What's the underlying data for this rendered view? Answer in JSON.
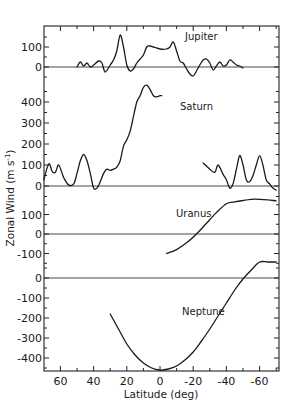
{
  "chart_data": {
    "type": "line",
    "title": "",
    "xlabel": "Latitude (deg)",
    "ylabel": "Zonal Wind (m s⁻¹)",
    "ylabel_parts": {
      "main": "Zonal Wind (m s",
      "sup": "-1",
      "close": ")"
    },
    "xlim": [
      70,
      -72
    ],
    "x_ticks": [
      60,
      40,
      20,
      0,
      -20,
      -40,
      -60
    ],
    "x_tick_labels": [
      "60",
      "40",
      "20",
      "0",
      "-20",
      "-40",
      "-60"
    ],
    "grid": false,
    "legend": "none (curves labeled inline)",
    "panels": [
      {
        "name": "Jupiter",
        "y_ticks": [
          100,
          0
        ],
        "y_tick_labels": [
          "100",
          "0"
        ],
        "zero_y": 67,
        "px_per_unit": 0.2,
        "label_pos": [
          185,
          40
        ],
        "x": [
          50,
          48,
          46,
          44,
          42,
          40,
          37,
          35,
          33,
          30,
          28,
          26,
          24,
          22,
          20,
          18,
          16,
          14,
          12,
          10,
          8,
          6,
          4,
          2,
          0,
          -2,
          -4,
          -6,
          -8,
          -10,
          -12,
          -14,
          -16,
          -18,
          -20,
          -22,
          -24,
          -26,
          -28,
          -30,
          -32,
          -34,
          -36,
          -38,
          -40,
          -42,
          -44,
          -46,
          -48,
          -50
        ],
        "values": [
          0,
          25,
          5,
          20,
          0,
          10,
          30,
          20,
          -25,
          10,
          35,
          80,
          160,
          100,
          10,
          -20,
          -10,
          20,
          40,
          60,
          100,
          105,
          100,
          95,
          90,
          88,
          90,
          100,
          125,
          80,
          30,
          20,
          -10,
          -35,
          -45,
          -20,
          10,
          35,
          40,
          20,
          -15,
          5,
          25,
          5,
          10,
          35,
          25,
          10,
          5,
          -5
        ]
      },
      {
        "name": "Saturn",
        "y_ticks": [
          400,
          300,
          200,
          100,
          0
        ],
        "y_tick_labels": [
          "400",
          "300",
          "200",
          "100",
          "0"
        ],
        "zero_y": 186,
        "px_per_unit": 0.21,
        "label_pos": [
          180,
          110
        ],
        "segments": [
          {
            "x": [
              70,
              67,
              65,
              63,
              61,
              58,
              55,
              52,
              50,
              48,
              46,
              44,
              42,
              40,
              38,
              36,
              34,
              32,
              30,
              28,
              26,
              24,
              22,
              20,
              18,
              16,
              14,
              12,
              10,
              8,
              6,
              4,
              2,
              0,
              -1
            ],
            "values": [
              30,
              105,
              70,
              65,
              100,
              40,
              5,
              10,
              60,
              120,
              150,
              120,
              60,
              -10,
              -10,
              20,
              60,
              80,
              75,
              80,
              90,
              120,
              190,
              220,
              260,
              330,
              400,
              430,
              470,
              480,
              460,
              430,
              425,
              430,
              430
            ]
          },
          {
            "x": [
              -26,
              -30,
              -33,
              -35,
              -38,
              -40,
              -42,
              -44,
              -46,
              -48,
              -50,
              -52,
              -54,
              -56,
              -58,
              -60,
              -62,
              -64,
              -66,
              -68,
              -70
            ],
            "values": [
              110,
              80,
              65,
              100,
              55,
              30,
              -10,
              10,
              80,
              145,
              100,
              30,
              20,
              50,
              100,
              145,
              100,
              30,
              10,
              -10,
              -20
            ]
          }
        ]
      },
      {
        "name": "Uranus",
        "y_ticks": [
          100,
          0,
          -100
        ],
        "y_tick_labels": [
          "100",
          "0",
          "-100"
        ],
        "zero_y": 234,
        "px_per_unit": 0.195,
        "label_pos": [
          176,
          217
        ],
        "x": [
          -4,
          -10,
          -16,
          -22,
          -28,
          -34,
          -40,
          -45,
          -50,
          -55,
          -60,
          -65,
          -70
        ],
        "values": [
          -100,
          -80,
          -45,
          0,
          55,
          110,
          155,
          165,
          172,
          178,
          178,
          175,
          170
        ]
      },
      {
        "name": "Neptune",
        "y_ticks": [
          0,
          -100,
          -200,
          -300,
          -400
        ],
        "y_tick_labels": [
          "0",
          "-100",
          "-200",
          "-300",
          "-400"
        ],
        "zero_y": 278,
        "px_per_unit": 0.2,
        "label_pos": [
          182,
          315
        ],
        "x": [
          30,
          25,
          20,
          15,
          10,
          5,
          0,
          -5,
          -10,
          -15,
          -20,
          -25,
          -30,
          -35,
          -40,
          -45,
          -50,
          -55,
          -60,
          -65,
          -70
        ],
        "values": [
          -180,
          -255,
          -330,
          -385,
          -425,
          -450,
          -460,
          -455,
          -440,
          -410,
          -370,
          -315,
          -255,
          -190,
          -125,
          -60,
          -5,
          40,
          80,
          80,
          80
        ]
      }
    ]
  }
}
